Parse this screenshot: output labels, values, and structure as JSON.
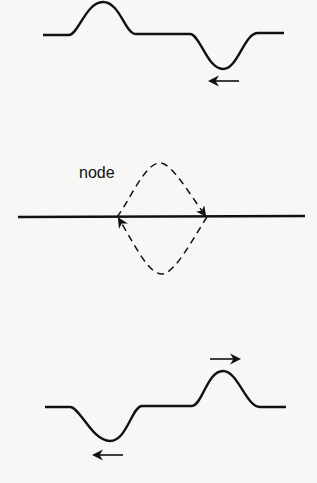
{
  "diagram": {
    "title": "",
    "labels": {
      "node": "node"
    },
    "colors": {
      "stroke": "#111111",
      "background": "#f7f7f5"
    },
    "panels": [
      {
        "name": "top",
        "description": "upward pulse on left and downward pulse on right moving left (arrow under trough)"
      },
      {
        "name": "middle",
        "description": "superposition at node with dashed diamond arrows"
      },
      {
        "name": "bottom",
        "description": "downward pulse moving left and upward pulse moving right"
      }
    ]
  }
}
